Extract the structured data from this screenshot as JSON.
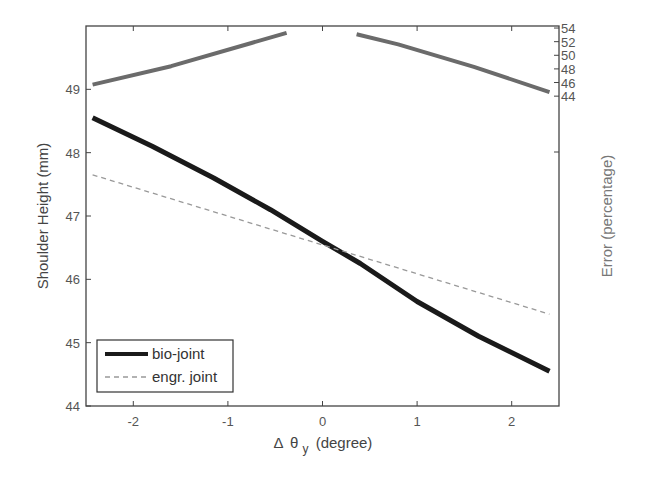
{
  "chart_data": {
    "type": "line",
    "title": "",
    "xlabel": "Δ θ_y (degree)",
    "xlabel_parts": {
      "delta": "Δ",
      "theta": "θ",
      "sub": "y",
      "unit": "(degree)"
    },
    "ylabel": "Shoulder Height (mm)",
    "ylabel_right": "Error (percentage)",
    "xlim": [
      -2.5,
      2.5
    ],
    "ylim": [
      44,
      50
    ],
    "ylim_right": [
      -1.5,
      54.3
    ],
    "x_ticks": [
      -2,
      -1,
      0,
      1,
      2
    ],
    "x_tick_labels": [
      "-2",
      "-1",
      "0",
      "1",
      "2"
    ],
    "y_ticks": [
      44,
      45,
      46,
      47,
      48,
      49
    ],
    "y_tick_labels": [
      "44",
      "45",
      "46",
      "47",
      "48",
      "49"
    ],
    "y_right_ticks": [
      44,
      46,
      48,
      50,
      52,
      54
    ],
    "y_right_tick_labels": [
      "44",
      "46",
      "48",
      "50",
      "52",
      "54"
    ],
    "grid": false,
    "legend_position": "lower left",
    "series": [
      {
        "name": "bio-joint",
        "axis": "left",
        "style": "solid",
        "color": "#1a1a1a",
        "width": 5,
        "x": [
          -2.43,
          -1.8,
          -1.15,
          -0.55,
          0.0,
          0.4,
          1.0,
          1.65,
          2.4
        ],
        "y": [
          48.55,
          48.1,
          47.6,
          47.1,
          46.6,
          46.25,
          45.65,
          45.1,
          44.55
        ]
      },
      {
        "name": "engr. joint",
        "axis": "left",
        "style": "dashed",
        "color": "#999999",
        "width": 1.3,
        "x": [
          -2.43,
          2.4
        ],
        "y": [
          47.65,
          45.45
        ]
      },
      {
        "name": "error",
        "axis": "right",
        "style": "solid",
        "color": "#6b6b6b",
        "width": 4,
        "in_legend": false,
        "segments": [
          {
            "x": [
              -2.43,
              -1.6,
              -0.75,
              -0.38
            ],
            "y": [
              45.7,
              48.4,
              51.8,
              53.3
            ]
          },
          {
            "x": [
              0.36,
              0.8,
              1.6,
              2.4
            ],
            "y": [
              53.1,
              51.6,
              48.3,
              44.6
            ]
          }
        ]
      }
    ]
  },
  "legend": {
    "items": [
      {
        "label": "bio-joint"
      },
      {
        "label": "engr. joint"
      }
    ]
  }
}
